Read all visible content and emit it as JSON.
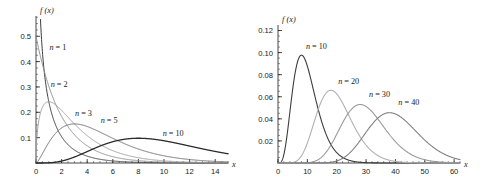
{
  "figure": {
    "background": "#ffffff",
    "panels": [
      "left",
      "right"
    ]
  },
  "chart_data": [
    {
      "id": "left",
      "type": "line",
      "title": "",
      "xlabel": "x",
      "ylabel": "f (x)",
      "xlim": [
        0,
        15
      ],
      "ylim": [
        0,
        0.58
      ],
      "grid": false,
      "legend_position": "inline-annotations",
      "xticks": [
        0,
        2,
        4,
        6,
        8,
        10,
        12,
        14
      ],
      "xtick_labels": [
        "0",
        "2",
        "4",
        "6",
        "8",
        "10",
        "12",
        "14"
      ],
      "xminor_step": 0.5,
      "yticks": [
        0.1,
        0.2,
        0.3,
        0.4,
        0.5
      ],
      "ytick_labels": [
        "0.1",
        "0.2",
        "0.3",
        "0.4",
        "0.5"
      ],
      "yminor_step": 0.025,
      "series": [
        {
          "name": "n = 1",
          "n": 1,
          "color": "#3d3d3d",
          "width": 1.0,
          "label_x": 1.05,
          "label_y": 0.445
        },
        {
          "name": "n = 2",
          "n": 2,
          "color": "#8c8c8c",
          "width": 1.0,
          "label_x": 1.15,
          "label_y": 0.3
        },
        {
          "name": "n = 3",
          "n": 3,
          "color": "#9e9e9e",
          "width": 1.0,
          "label_x": 3.05,
          "label_y": 0.186
        },
        {
          "name": "n = 5",
          "n": 5,
          "color": "#6b6b6b",
          "width": 1.0,
          "label_x": 5.05,
          "label_y": 0.158
        },
        {
          "name": "n = 10",
          "n": 10,
          "color": "#2b2b2b",
          "width": 1.3,
          "label_x": 9.9,
          "label_y": 0.108
        }
      ]
    },
    {
      "id": "right",
      "type": "line",
      "title": "",
      "xlabel": "x",
      "ylabel": "f (x)",
      "xlim": [
        0,
        62
      ],
      "ylim": [
        0,
        0.125
      ],
      "grid": false,
      "legend_position": "inline-annotations",
      "xticks": [
        0,
        10,
        20,
        30,
        40,
        50,
        60
      ],
      "xtick_labels": [
        "0",
        "10",
        "20",
        "30",
        "40",
        "50",
        "60"
      ],
      "xminor_step": 2,
      "yticks": [
        0.02,
        0.04,
        0.06,
        0.08,
        0.1,
        0.12
      ],
      "ytick_labels": [
        "0.02",
        "0.04",
        "0.06",
        "0.08",
        "0.10",
        "0.12"
      ],
      "yminor_step": 0.005,
      "series": [
        {
          "name": "n = 10",
          "n": 10,
          "color": "#3d3d3d",
          "width": 1.1,
          "label_x": 9.5,
          "label_y": 0.1035,
          "peak": 0.0988
        },
        {
          "name": "n = 20",
          "n": 20,
          "color": "#b0b0b0",
          "width": 1.1,
          "label_x": 20.5,
          "label_y": 0.0718,
          "peak": 0.066
        },
        {
          "name": "n = 30",
          "n": 30,
          "color": "#999999",
          "width": 1.1,
          "label_x": 31.0,
          "label_y": 0.06,
          "peak": 0.0534
        },
        {
          "name": "n = 40",
          "n": 40,
          "color": "#808080",
          "width": 1.1,
          "label_x": 41.0,
          "label_y": 0.0523,
          "peak": 0.0462
        }
      ]
    }
  ]
}
